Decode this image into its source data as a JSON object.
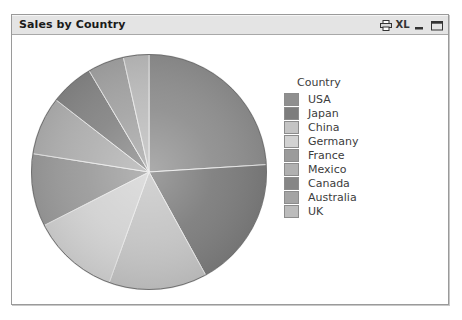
{
  "window": {
    "title": "Sales by Country",
    "buttons": [
      {
        "name": "print-icon",
        "label": "",
        "icon": "printer"
      },
      {
        "name": "excel-export-icon",
        "label": "XL",
        "icon": "xl"
      },
      {
        "name": "minimize-button",
        "label": "",
        "icon": "minimize"
      },
      {
        "name": "maximize-button",
        "label": "",
        "icon": "maximize"
      }
    ]
  },
  "legend": {
    "title": "Country"
  },
  "chart_data": {
    "type": "pie",
    "title": "Sales by Country",
    "legend_title": "Country",
    "legend_position": "right",
    "start_angle": 0,
    "direction": "clockwise",
    "categories": [
      "USA",
      "Japan",
      "China",
      "Germany",
      "France",
      "Mexico",
      "Canada",
      "Australia",
      "UK"
    ],
    "values": [
      24.0,
      18.0,
      13.5,
      12.0,
      10.0,
      8.0,
      6.0,
      5.0,
      3.5
    ],
    "value_unit": "percent",
    "colors": [
      "#8f8f8f",
      "#7d7d7d",
      "#c4c4c4",
      "#d2d2d2",
      "#9b9b9b",
      "#b0b0b0",
      "#868686",
      "#a4a4a4",
      "#bcbcbc"
    ],
    "slice_border_color": "#e8e8e8",
    "grid": false,
    "xlabel": "",
    "ylabel": ""
  }
}
